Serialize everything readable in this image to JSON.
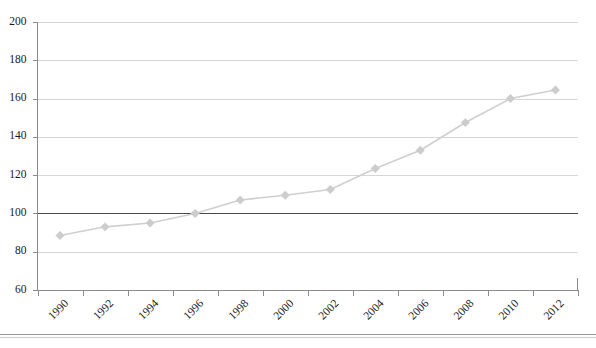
{
  "chart_data": {
    "type": "line",
    "title": "",
    "subtitle": "",
    "xlabel": "",
    "ylabel": "",
    "categories": [
      "1990",
      "1992",
      "1994",
      "1996",
      "1998",
      "2000",
      "2002",
      "2004",
      "2006",
      "2008",
      "2010",
      "2012"
    ],
    "x": [
      1990,
      1992,
      1994,
      1996,
      1998,
      2000,
      2002,
      2004,
      2006,
      2008,
      2010,
      2012
    ],
    "values": [
      88.5,
      93.0,
      95.0,
      100.0,
      107.0,
      109.5,
      112.5,
      123.5,
      133.0,
      147.5,
      160.0,
      164.5
    ],
    "series": [
      {
        "name": "Index",
        "values": [
          88.5,
          93.0,
          95.0,
          100.0,
          107.0,
          109.5,
          112.5,
          123.5,
          133.0,
          147.5,
          160.0,
          164.5
        ]
      }
    ],
    "ylim": [
      60,
      200
    ],
    "yticks": [
      60,
      80,
      100,
      120,
      140,
      160,
      180,
      200
    ],
    "ytick_labels": [
      "60",
      "80",
      "100",
      "120",
      "140",
      "160",
      "180",
      "200"
    ],
    "xtick_labels": [
      "1990",
      "1992",
      "1994",
      "1996",
      "1998",
      "2000",
      "2002",
      "2004",
      "2006",
      "2008",
      "2010",
      "2012"
    ],
    "xtick_rotation": -45,
    "grid": "horizontal",
    "legend": "none",
    "annotations": [
      {
        "type": "hline",
        "value": 100,
        "label": "",
        "color": "#4a4a4a"
      }
    ],
    "marker": "diamond",
    "line_color": "#cfcfcf",
    "marker_color": "#cccccc",
    "gridline_color": "#d6d6d6",
    "axis_color": "#8c8c8c",
    "background": "#ffffff"
  }
}
